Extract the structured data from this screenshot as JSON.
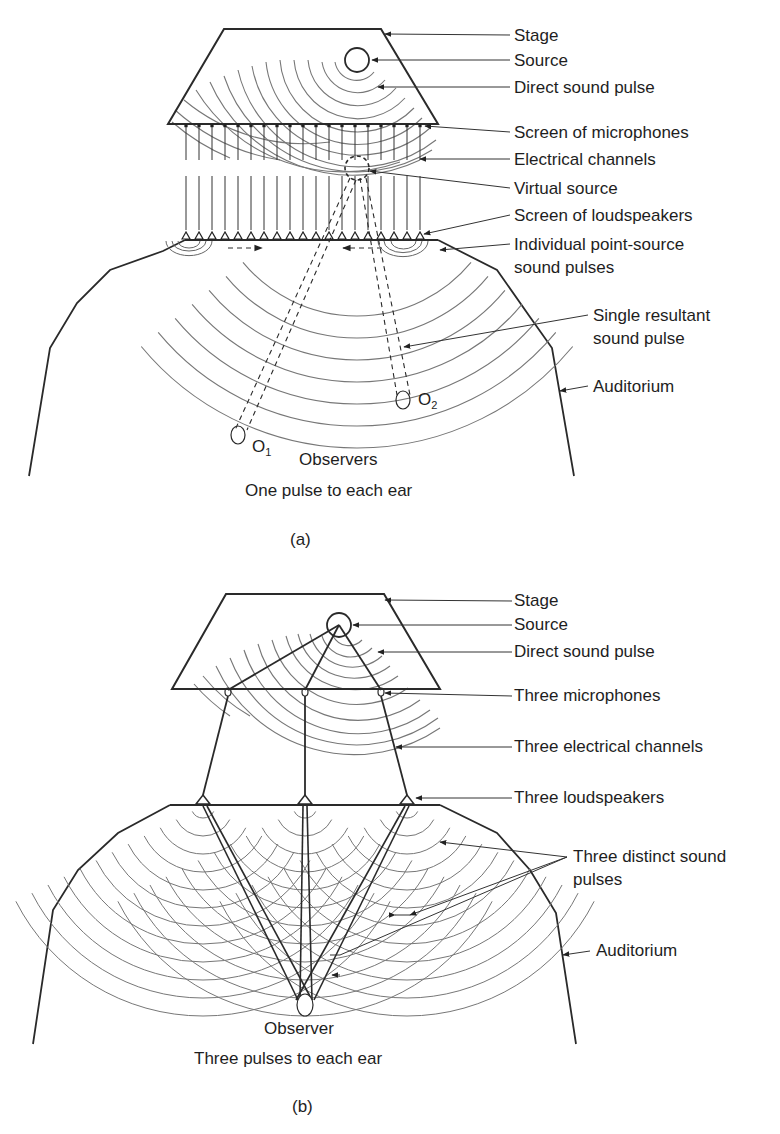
{
  "figure_a": {
    "caption": "(a)",
    "labels": {
      "stage": "Stage",
      "source": "Source",
      "direct_pulse": "Direct sound pulse",
      "mic_screen": "Screen of microphones",
      "channels": "Electrical channels",
      "virtual_source": "Virtual source",
      "speaker_screen": "Screen of loudspeakers",
      "point_pulses_1": "Individual point-source",
      "point_pulses_2": "sound pulses",
      "resultant_1": "Single resultant",
      "resultant_2": "sound pulse",
      "auditorium": "Auditorium",
      "observer1": "O",
      "observer1_sub": "1",
      "observer2": "O",
      "observer2_sub": "2",
      "observers": "Observers",
      "bottom_note": "One pulse to each ear"
    },
    "microphone_count": 19,
    "loudspeaker_count": 19
  },
  "figure_b": {
    "caption": "(b)",
    "labels": {
      "stage": "Stage",
      "source": "Source",
      "direct_pulse": "Direct sound pulse",
      "mics": "Three microphones",
      "channels": "Three electrical channels",
      "speakers": "Three loudspeakers",
      "distinct_1": "Three distinct sound",
      "distinct_2": "pulses",
      "auditorium": "Auditorium",
      "observer": "Observer",
      "bottom_note": "Three pulses to each ear"
    },
    "microphone_count": 3,
    "loudspeaker_count": 3
  },
  "colors": {
    "line": "#2a2a2a",
    "wave": "#707070",
    "background": "#ffffff"
  }
}
